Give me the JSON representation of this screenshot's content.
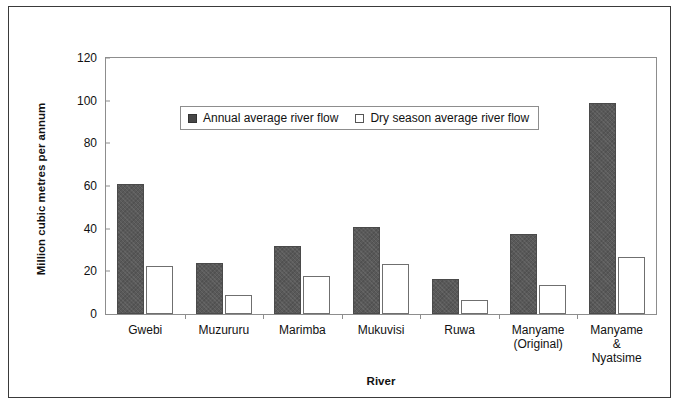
{
  "chart_data": {
    "type": "bar",
    "title": "",
    "xlabel": "River",
    "ylabel": "Million cubic metres per annum",
    "categories": [
      "Gwebi",
      "Muzururu",
      "Marimba",
      "Mukuvisi",
      "Ruwa",
      "Manyame\n(Original)",
      "Manyame\n& Nyatsime"
    ],
    "series": [
      {
        "name": "Annual average river flow",
        "color": "#595959",
        "values": [
          61,
          24,
          32,
          41,
          16.5,
          37.5,
          99
        ]
      },
      {
        "name": "Dry season average river flow",
        "color": "#ffffff",
        "values": [
          22.5,
          9,
          18,
          23.5,
          6.5,
          13.5,
          26.5
        ]
      }
    ],
    "ylim": [
      0,
      120
    ],
    "yticks": [
      0,
      20,
      40,
      60,
      80,
      100,
      120
    ],
    "ytick_labels": [
      "0",
      "20",
      "40",
      "60",
      "80",
      "100",
      "120"
    ],
    "grid": false,
    "legend_position": "inside-top-left"
  },
  "legend": {
    "items": [
      {
        "label": "Annual average river flow",
        "swatch": "filled-square-icon"
      },
      {
        "label": "Dry season average river flow",
        "swatch": "empty-square-icon"
      }
    ]
  }
}
